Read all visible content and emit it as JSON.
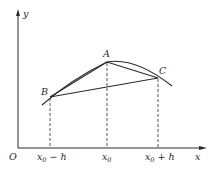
{
  "diagram": {
    "type": "function-curve-with-secants",
    "axes": {
      "x_label": "x",
      "y_label": "y",
      "origin_label": "O"
    },
    "points": [
      {
        "name": "A",
        "label": "A",
        "x_tick": "x0"
      },
      {
        "name": "B",
        "label": "B",
        "x_tick": "x0 − h"
      },
      {
        "name": "C",
        "label": "C",
        "x_tick": "x0 + h"
      }
    ],
    "tick_labels": {
      "left": {
        "base": "x",
        "sub": "0",
        "suffix": " − h"
      },
      "mid": {
        "base": "x",
        "sub": "0",
        "suffix": ""
      },
      "right": {
        "base": "x",
        "sub": "0",
        "suffix": " + h"
      }
    },
    "segments": [
      "BA",
      "AC",
      "BC"
    ],
    "colors": {
      "stroke": "#2a2a2a",
      "background": "#ffffff"
    }
  }
}
